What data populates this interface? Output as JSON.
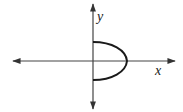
{
  "diagram": {
    "type": "coordinate-graph",
    "axes": {
      "x_label": "x",
      "y_label": "y",
      "color": "#333333"
    },
    "curve": {
      "description": "right-opening half-parabola (half-ellipse) to the right of the y-axis",
      "color": "#1a1a1a"
    }
  }
}
